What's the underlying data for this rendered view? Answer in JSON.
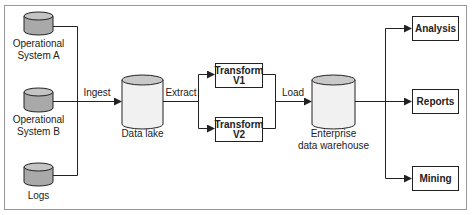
{
  "diagram": {
    "sources": [
      {
        "id": "opA",
        "label_line1": "Operational",
        "label_line2": "System A"
      },
      {
        "id": "opB",
        "label_line1": "Operational",
        "label_line2": "System B"
      },
      {
        "id": "logs",
        "label_line1": "Logs",
        "label_line2": ""
      }
    ],
    "edges": {
      "ingest": "Ingest",
      "extract": "Extract",
      "load": "Load"
    },
    "data_lake": {
      "label": "Data lake"
    },
    "transforms": [
      {
        "line1": "Transform",
        "line2": "V1"
      },
      {
        "line1": "Transform",
        "line2": "V2"
      }
    ],
    "warehouse": {
      "label_line1": "Enterprise",
      "label_line2": "data warehouse"
    },
    "outputs": [
      {
        "label": "Analysis"
      },
      {
        "label": "Reports"
      },
      {
        "label": "Mining"
      }
    ],
    "colors": {
      "source_cylinder_fill": "#a9a9a9",
      "source_cylinder_top": "#c4c4c4",
      "store_cylinder_fill": "#f1f1f1",
      "store_cylinder_top": "#c9c9c9",
      "stroke": "#222222",
      "frame": "#999999"
    }
  }
}
